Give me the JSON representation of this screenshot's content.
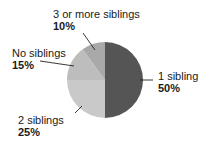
{
  "chart_data": {
    "type": "pie",
    "title": "",
    "categories": [
      "1 sibling",
      "2 siblings",
      "No siblings",
      "3 or more siblings"
    ],
    "values": [
      50,
      25,
      15,
      10
    ],
    "unit": "%",
    "colors": [
      "#555555",
      "#c9c9c9",
      "#bdbdbd",
      "#a9a9a9"
    ],
    "start_angle_deg": 0,
    "direction": "clockwise",
    "legend": "none (direct labels with leader lines)",
    "labels": [
      {
        "name": "1 sibling",
        "pct": "50%"
      },
      {
        "name": "2 siblings",
        "pct": "25%"
      },
      {
        "name": "No siblings",
        "pct": "15%"
      },
      {
        "name": "3 or more siblings",
        "pct": "10%"
      }
    ]
  }
}
